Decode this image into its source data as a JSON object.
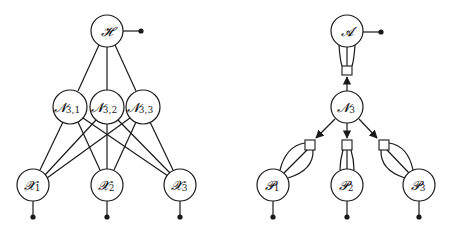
{
  "left_diagram": {
    "nodes": {
      "H": {
        "symbol": "𝓗",
        "sub": ""
      },
      "N31": {
        "symbol": "𝓝",
        "sub": "3,1"
      },
      "N32": {
        "symbol": "𝓝",
        "sub": "3,2"
      },
      "N33": {
        "symbol": "𝓝",
        "sub": "3,3"
      },
      "X1": {
        "symbol": "𝓧",
        "sub": "1"
      },
      "X2": {
        "symbol": "𝓧",
        "sub": "2"
      },
      "X3": {
        "symbol": "𝓧",
        "sub": "3"
      }
    }
  },
  "right_diagram": {
    "nodes": {
      "A": {
        "symbol": "𝓐",
        "sub": ""
      },
      "N3": {
        "symbol": "𝓝",
        "sub": "3"
      },
      "P1": {
        "symbol": "𝓟",
        "sub": "1"
      },
      "P2": {
        "symbol": "𝓟",
        "sub": "2"
      },
      "P3": {
        "symbol": "𝓟",
        "sub": "3"
      }
    }
  },
  "colors": {
    "stroke": "#1a1a1a",
    "background": "#ffffff"
  }
}
